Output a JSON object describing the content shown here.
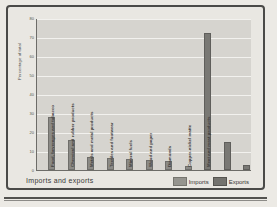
{
  "figure": {
    "footer_title": "Imports and exports"
  },
  "legend": {
    "items": [
      {
        "label": "Imports",
        "color": "#95948f"
      },
      {
        "label": "Exports",
        "color": "#73726e"
      }
    ]
  },
  "chart_data": {
    "type": "bar",
    "title": "Imports and exports",
    "xlabel": "",
    "ylabel": "Percentage of total",
    "ylim": [
      0,
      80
    ],
    "ytick_step": 10,
    "yticks": [
      "0",
      "10",
      "20",
      "30",
      "40",
      "50",
      "60",
      "70",
      "80"
    ],
    "grid": true,
    "legend_position": "bottom-right",
    "categories": [
      "Machinery, electrical goods, transportation equipment",
      "Food, beverages and tobacco",
      "Chemical and rubber products",
      "Metals and metal products",
      "Textiles and footwear",
      "Mineral fuels",
      "Wood and paper",
      "Diamonds",
      "Copper-nickel matte",
      "Meat and meat products"
    ],
    "series": [
      {
        "name": "Imports",
        "color": "#95948f",
        "values": [
          28,
          16,
          7,
          6.5,
          6,
          5.5,
          4.5,
          2,
          null,
          null
        ]
      },
      {
        "name": "Exports",
        "color": "#73726e",
        "values": [
          null,
          null,
          null,
          null,
          null,
          null,
          null,
          null,
          72,
          15
        ]
      }
    ],
    "bars": [
      {
        "category": "Machinery, electrical goods, transportation equipment",
        "series": "Imports",
        "value": 28
      },
      {
        "category": "Food, beverages and tobacco",
        "series": "Imports",
        "value": 16
      },
      {
        "category": "Chemical and rubber products",
        "series": "Imports",
        "value": 7
      },
      {
        "category": "Metals and metal products",
        "series": "Imports",
        "value": 6.5
      },
      {
        "category": "Textiles and footwear",
        "series": "Imports",
        "value": 6
      },
      {
        "category": "Mineral fuels",
        "series": "Imports",
        "value": 5.5
      },
      {
        "category": "Wood and paper",
        "series": "Imports",
        "value": 4.5
      },
      {
        "category": "Diamonds",
        "series": "Imports",
        "value": 2
      },
      {
        "category": "Copper-nickel matte",
        "series": "Exports",
        "value": 72
      },
      {
        "category": "Meat and meat products",
        "series": "Exports",
        "value": 15
      },
      {
        "category": "",
        "series": "Exports",
        "value": 2.5
      }
    ]
  }
}
